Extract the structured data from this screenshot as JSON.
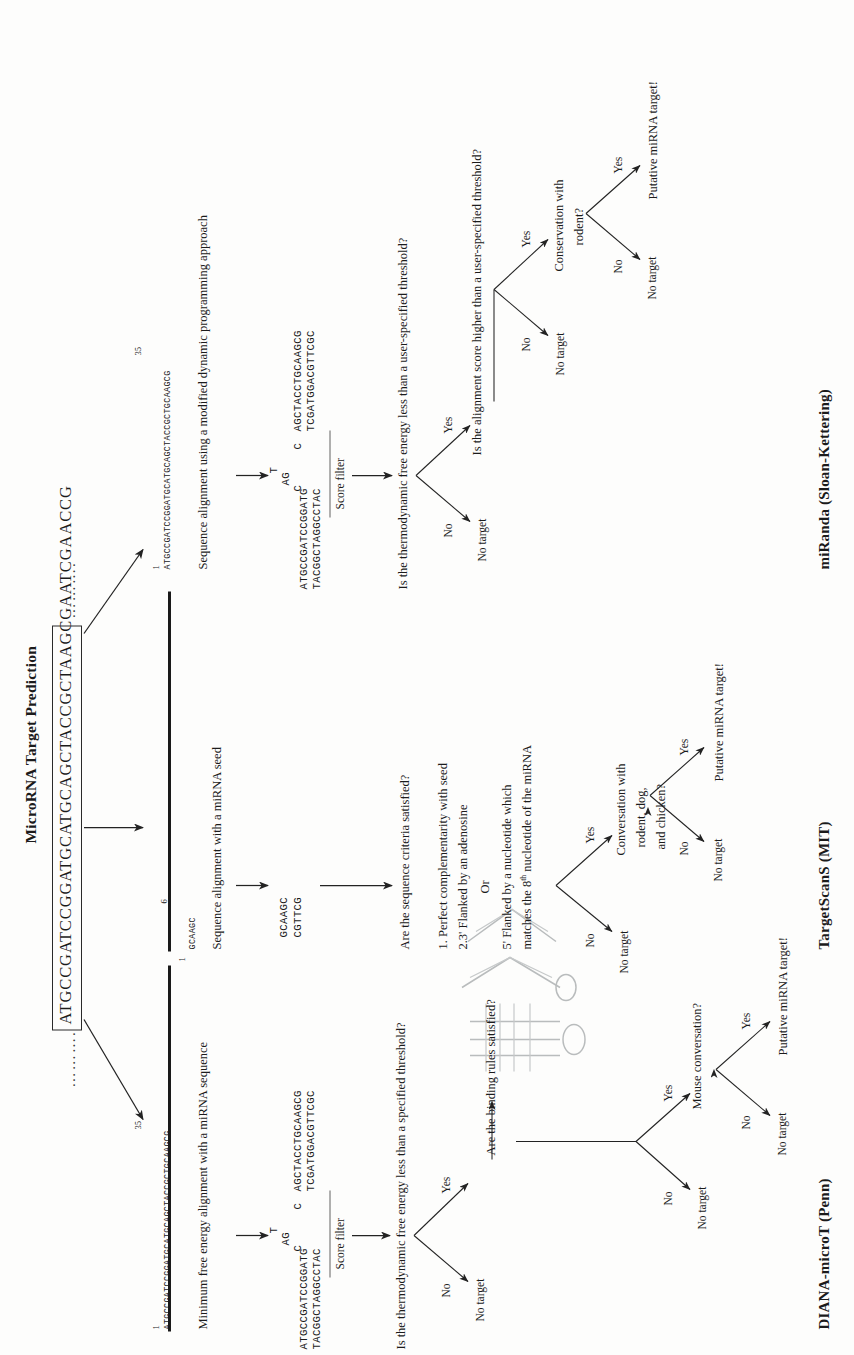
{
  "figure": {
    "title": "MicroRNA Target Prediction",
    "mrna_sequence": "ATGCCGATCCGGATGCATGCAGCTACCGCTAAGCGAATCGAACCG",
    "leading_dots": "……….",
    "trailing_dots": "……….",
    "divider_count": 2
  },
  "pipelines": [
    {
      "id": "diana",
      "name": "DIANA-microT (Penn)",
      "branch_index_label": "1",
      "branch_end_label": "35",
      "seq_raw": "ATGCCGATCCGGATGCATGCAGCTACCGCTGCAAGCG",
      "step1": "Minimum free energy alignment with a miRNA sequence",
      "duplex": {
        "top_left": "ATGCCGATCCGGATG",
        "bottom_left": "TACGGCTAGGCCTAC",
        "bulge_top": "T",
        "bulge_mid": "AG",
        "bulge_c1": "C",
        "bulge_c2": "C",
        "top_right": "AGCTACCTGCAAGCG",
        "bottom_right": "TCGATGGACGTTCGC"
      },
      "filter_label": "Score filter",
      "q1": "Is the thermodynamic free energy less than a specified threshold?",
      "q1_no": "No",
      "q1_no_out": "No target",
      "q1_yes": "Yes",
      "q2": "Are the binding rules satisfied?",
      "q3_no": "No",
      "q3_no_out": "No target",
      "q3_yes": "Yes",
      "q3": "Mouse conversation?",
      "q4_no": "No",
      "q4_no_out": "No target",
      "q4_yes": "Yes",
      "q4_out": "Putative miRNA target!"
    },
    {
      "id": "targetscans",
      "name": "TargetScanS (MIT)",
      "branch_index_label": "1",
      "branch_end_label": "6",
      "seq_raw": "GCAAGC",
      "step1": "Sequence alignment with a miRNA seed",
      "duplex": {
        "top": "GCAAGC",
        "bottom": "CGTTCG"
      },
      "q1": "Are the sequence criteria satisfied?",
      "criteria": [
        "1. Perfect complementarity with seed",
        "2.3' Flanked by an adenosine",
        "Or",
        "5' Flanked by a nucleotide which",
        "matches the 8th nucleotide of the miRNA"
      ],
      "criteria_sup": "th",
      "q1_no": "No",
      "q1_no_out": "No target",
      "q1_yes": "Yes",
      "q2_line1": "Conversation with",
      "q2_line2": "rodent, dog,",
      "q2_line3": "and chicken?",
      "q2_no": "No",
      "q2_no_out": "No target",
      "q2_yes": "Yes",
      "q2_out": "Putative miRNA target!"
    },
    {
      "id": "miranda",
      "name": "miRanda (Sloan-Kettering)",
      "branch_index_label": "1",
      "branch_end_label": "35",
      "seq_raw": "ATGCCGATCCGGATGCATGCAGCTACCGCTGCAAGCG",
      "step1": "Sequence alignment using a modified dynamic programming approach",
      "duplex": {
        "top_left": "ATGCCGATCCGGATG",
        "bottom_left": "TACGGCTAGGCCTAC",
        "bulge_top": "T",
        "bulge_mid": "AG",
        "bulge_c1": "C",
        "bulge_c2": "C",
        "top_right": "AGCTACCTGCAAGCG",
        "bottom_right": "TCGATGGACGTTCGC"
      },
      "filter_label": "Score filter",
      "q1": "Is the thermodynamic free energy less than a user-specified threshold?",
      "q1_no": "No",
      "q1_no_out": "No target",
      "q1_yes": "Yes",
      "q2": "Is the alignment score higher than a user-specified threshold?",
      "q2_no": "No",
      "q2_no_out": "No target",
      "q2_yes": "Yes",
      "q3_line1": "Conservation with",
      "q3_line2": "rodent?",
      "q3_no": "No",
      "q3_no_out": "No target",
      "q3_yes": "Yes",
      "q3_out": "Putative miRNA target!"
    }
  ],
  "colors": {
    "ink": "#1b1b1b",
    "rule": "#1a1a1a",
    "paper": "#fdfdfc",
    "faded": "#b9bcbd"
  }
}
